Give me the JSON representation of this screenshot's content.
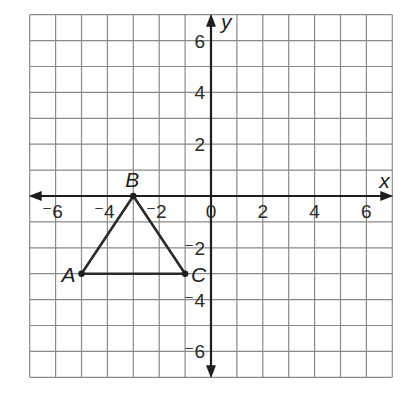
{
  "diagram": {
    "type": "coordinate-plane",
    "grid": {
      "xmin": -7,
      "xmax": 7,
      "ymin": -7,
      "ymax": 7,
      "step": 1
    },
    "axes": {
      "x_label": "x",
      "y_label": "y"
    },
    "x_ticks": [
      {
        "value": -6,
        "label": "-6"
      },
      {
        "value": -4,
        "label": "-4"
      },
      {
        "value": -2,
        "label": "-2"
      },
      {
        "value": 0,
        "label": "0"
      },
      {
        "value": 2,
        "label": "2"
      },
      {
        "value": 4,
        "label": "4"
      },
      {
        "value": 6,
        "label": "6"
      }
    ],
    "y_ticks": [
      {
        "value": 6,
        "label": "6"
      },
      {
        "value": 4,
        "label": "4"
      },
      {
        "value": 2,
        "label": "2"
      },
      {
        "value": -2,
        "label": "-2"
      },
      {
        "value": -4,
        "label": "-4"
      },
      {
        "value": -6,
        "label": "-6"
      }
    ],
    "triangle": {
      "points": [
        {
          "name": "A",
          "x": -5,
          "y": -3
        },
        {
          "name": "B",
          "x": -3,
          "y": 0
        },
        {
          "name": "C",
          "x": -1,
          "y": -3
        }
      ]
    },
    "colors": {
      "grid": "#8a8a8a",
      "axis": "#1e1e1e",
      "shape": "#2a2a2a"
    }
  }
}
